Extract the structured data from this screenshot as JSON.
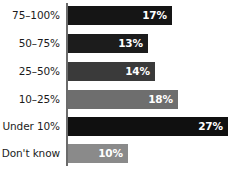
{
  "chart_data": {
    "type": "bar",
    "title": "",
    "subtitle": "",
    "xlabel": "",
    "ylabel": "",
    "orientation": "horizontal",
    "grid": false,
    "legend": "none",
    "xlim": [
      0,
      30
    ],
    "categories": [
      "75–100%",
      "50–75%",
      "25–50%",
      "10–25%",
      "Under 10%",
      "Don't know"
    ],
    "values": [
      17,
      13,
      14,
      18,
      27,
      10
    ],
    "value_labels": [
      "17%",
      "13%",
      "14%",
      "18%",
      "27%",
      "10%"
    ],
    "bar_colors": [
      "#151515",
      "#1c1c1c",
      "#3a3a3a",
      "#6e6e6e",
      "#101010",
      "#8a8a8a"
    ],
    "axis_color": "#6b6b6b",
    "label_color": "#1b1b1b",
    "value_label_color": "#ffffff",
    "background": "#ffffff"
  },
  "rows": [
    {
      "label": "75–100%",
      "value_label": "17%",
      "value": 17,
      "color": "#151515",
      "top": 6,
      "width": 104
    },
    {
      "label": "50–75%",
      "value_label": "13%",
      "value": 13,
      "color": "#1c1c1c",
      "top": 34,
      "width": 80
    },
    {
      "label": "25–50%",
      "value_label": "14%",
      "value": 14,
      "color": "#3a3a3a",
      "top": 62,
      "width": 87
    },
    {
      "label": "10–25%",
      "value_label": "18%",
      "value": 18,
      "color": "#6e6e6e",
      "top": 90,
      "width": 110
    },
    {
      "label": "Under 10%",
      "value_label": "27%",
      "value": 27,
      "color": "#101010",
      "top": 117,
      "width": 160
    },
    {
      "label": "Don't know",
      "value_label": "10%",
      "value": 10,
      "color": "#8a8a8a",
      "top": 144,
      "width": 60
    }
  ]
}
